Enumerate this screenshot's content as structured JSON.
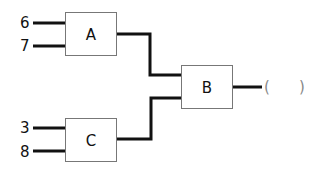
{
  "diagram": {
    "type": "logic-circuit",
    "boxes": [
      {
        "id": "A",
        "label": "A",
        "inputs": [
          "6",
          "7"
        ]
      },
      {
        "id": "B",
        "label": "B",
        "inputs": [
          "A",
          "C"
        ]
      },
      {
        "id": "C",
        "label": "C",
        "inputs": [
          "3",
          "8"
        ]
      }
    ],
    "inputs": {
      "a_top": "6",
      "a_bottom": "7",
      "c_top": "3",
      "c_bottom": "8"
    },
    "output": {
      "open_paren": "(",
      "close_paren": ")",
      "value": ""
    }
  }
}
